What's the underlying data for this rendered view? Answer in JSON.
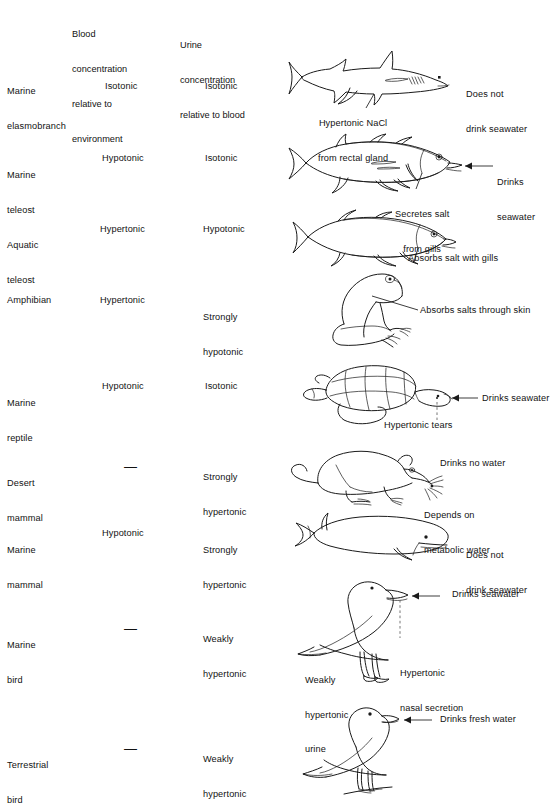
{
  "figure": {
    "type": "comparative-table-diagram"
  },
  "columns": {
    "animal": "",
    "blood": "Blood\nconcentration\nrelative to\nenvironment",
    "blood_lines": [
      "Blood",
      "concentration",
      "relative to",
      "environment"
    ],
    "urine": "Urine\nconcentration\nrelative to blood",
    "urine_lines": [
      "Urine",
      "concentration",
      "relative to blood"
    ],
    "illustration": ""
  },
  "rows": [
    {
      "id": "marine-elasmobranch",
      "animal_lines": [
        "Marine",
        "elasmobranch"
      ],
      "blood": "Isotonic",
      "urine": "Isotonic",
      "icon": "shark-icon",
      "annotations": [
        {
          "id": "shark-rectal",
          "lines": [
            "Hypertonic NaCl",
            "from rectal gland"
          ]
        },
        {
          "id": "shark-drink",
          "lines": [
            "Does not",
            "drink seawater"
          ]
        }
      ]
    },
    {
      "id": "marine-teleost",
      "animal_lines": [
        "Marine",
        "teleost"
      ],
      "blood": "Hypotonic",
      "urine": "Isotonic",
      "icon": "marine-teleost-fish-icon",
      "annotations": [
        {
          "id": "teleost-gills",
          "lines": [
            "Secretes salt",
            "from gills"
          ]
        },
        {
          "id": "teleost-drink",
          "lines": [
            "Drinks",
            "seawater"
          ]
        }
      ]
    },
    {
      "id": "aquatic-teleost",
      "animal_lines": [
        "Aquatic",
        "teleost"
      ],
      "blood": "Hypertonic",
      "urine": "Hypotonic",
      "icon": "aquatic-teleost-fish-icon",
      "annotations": [
        {
          "id": "aquatic-absorb",
          "lines": [
            "Absorbs salt with gills"
          ]
        }
      ]
    },
    {
      "id": "amphibian",
      "animal_lines": [
        "Amphibian"
      ],
      "blood": "Hypertonic",
      "urine": "Strongly\nhypotonic",
      "urine_lines": [
        "Strongly",
        "hypotonic"
      ],
      "icon": "frog-icon",
      "annotations": [
        {
          "id": "frog-skin",
          "lines": [
            "Absorbs salts through skin"
          ]
        }
      ]
    },
    {
      "id": "marine-reptile",
      "animal_lines": [
        "Marine",
        "reptile"
      ],
      "blood": "Hypotonic",
      "urine": "Isotonic",
      "icon": "sea-turtle-icon",
      "annotations": [
        {
          "id": "turtle-drink",
          "lines": [
            "Drinks seawater"
          ]
        },
        {
          "id": "turtle-tears",
          "lines": [
            "Hypertonic tears"
          ]
        }
      ]
    },
    {
      "id": "desert-mammal",
      "animal_lines": [
        "Desert",
        "mammal"
      ],
      "blood": "—",
      "urine": "Strongly\nhypertonic",
      "urine_lines": [
        "Strongly",
        "hypertonic"
      ],
      "icon": "kangaroo-rat-icon",
      "annotations": [
        {
          "id": "rat-nowater",
          "lines": [
            "Drinks no water"
          ]
        },
        {
          "id": "rat-metabolic",
          "lines": [
            "Depends on",
            "metabolic water"
          ]
        }
      ]
    },
    {
      "id": "marine-mammal",
      "animal_lines": [
        "Marine",
        "mammal"
      ],
      "blood": "Hypotonic",
      "urine": "Strongly\nhypertonic",
      "urine_lines": [
        "Strongly",
        "hypertonic"
      ],
      "icon": "whale-icon",
      "annotations": [
        {
          "id": "whale-drink",
          "lines": [
            "Does not",
            "drink seawater"
          ]
        }
      ]
    },
    {
      "id": "marine-bird",
      "animal_lines": [
        "Marine",
        "bird"
      ],
      "blood": "—",
      "urine": "Weakly\nhypertonic",
      "urine_lines": [
        "Weakly",
        "hypertonic"
      ],
      "icon": "seagull-icon",
      "annotations": [
        {
          "id": "gull-drink",
          "lines": [
            "Drinks seawater"
          ]
        },
        {
          "id": "gull-nasal",
          "lines": [
            "Hypertonic",
            "nasal secretion"
          ]
        },
        {
          "id": "gull-urine",
          "lines": [
            "Weakly",
            "hypertonic",
            "urine"
          ]
        }
      ]
    },
    {
      "id": "terrestrial-bird",
      "animal_lines": [
        "Terrestrial",
        "bird"
      ],
      "blood": "—",
      "urine": "Weakly\nhypertonic",
      "urine_lines": [
        "Weakly",
        "hypertonic"
      ],
      "icon": "songbird-icon",
      "annotations": [
        {
          "id": "songbird-drink",
          "lines": [
            "Drinks fresh water"
          ]
        }
      ]
    }
  ],
  "colors": {
    "ink": "#1a1a1a",
    "text": "#121212",
    "background": "#ffffff",
    "dashed_guide": "#666666"
  }
}
